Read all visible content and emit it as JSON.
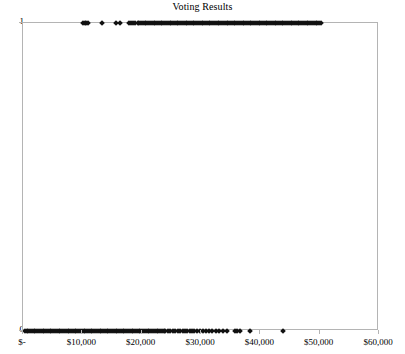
{
  "chart_data": {
    "type": "scatter",
    "title": "Voting Results",
    "xlabel": "",
    "ylabel": "",
    "xlim": [
      0,
      60000
    ],
    "ylim": [
      0,
      1
    ],
    "grid": false,
    "legend": null,
    "marker": "diamond",
    "marker_color": "#111111",
    "x_tick_labels": [
      "$-",
      "$10,000",
      "$20,000",
      "$30,000",
      "$40,000",
      "$50,000",
      "$60,000"
    ],
    "x_tick_values": [
      0,
      10000,
      20000,
      30000,
      40000,
      50000,
      60000
    ],
    "y_tick_labels": [
      "0",
      "1"
    ],
    "y_tick_values": [
      0,
      1
    ],
    "series": [
      {
        "name": "Voted (1)",
        "y": 1,
        "x": [
          10100,
          10450,
          10700,
          11000,
          13300,
          15600,
          16300,
          17900,
          18250,
          18600,
          18950,
          19300,
          19600,
          19900,
          20200,
          20500,
          20800,
          21100,
          21400,
          21700,
          22000,
          22300,
          22600,
          22900,
          23200,
          23500,
          23800,
          24100,
          24400,
          24700,
          25000,
          25300,
          25600,
          25900,
          26200,
          26500,
          26800,
          27100,
          27400,
          27700,
          28000,
          28300,
          28600,
          28900,
          29200,
          29500,
          29800,
          30100,
          30400,
          30700,
          31000,
          31300,
          31600,
          31900,
          32200,
          32500,
          32800,
          33100,
          33400,
          33700,
          34000,
          34300,
          34600,
          34900,
          35200,
          35500,
          35800,
          36100,
          36400,
          36700,
          37000,
          37300,
          37600,
          37900,
          38200,
          38500,
          38800,
          39100,
          39400,
          39700,
          40000,
          40300,
          40600,
          40900,
          41200,
          41500,
          41800,
          42100,
          42400,
          42700,
          43000,
          43300,
          43600,
          43900,
          44200,
          44500,
          44800,
          45100,
          45400,
          45700,
          46000,
          46300,
          46600,
          46900,
          47200,
          47500,
          47800,
          48100,
          48400,
          48700,
          49000,
          49300,
          49600,
          49900,
          50200
        ]
      },
      {
        "name": "Did not vote (0)",
        "y": 0,
        "x": [
          300,
          600,
          900,
          1200,
          1500,
          1800,
          2100,
          2400,
          2700,
          3000,
          3300,
          3600,
          3900,
          4200,
          4500,
          4800,
          5100,
          5400,
          5700,
          6000,
          6300,
          6600,
          6900,
          7200,
          7500,
          7800,
          8100,
          8400,
          8700,
          9000,
          9300,
          9600,
          9900,
          10200,
          10500,
          10800,
          11100,
          11400,
          11700,
          12000,
          12300,
          12600,
          12900,
          13200,
          13500,
          13800,
          14100,
          14400,
          14700,
          15000,
          15300,
          15600,
          15900,
          16200,
          16500,
          16800,
          17100,
          17400,
          17700,
          18000,
          18300,
          18600,
          18900,
          19200,
          19500,
          19800,
          20100,
          20400,
          20700,
          21000,
          21300,
          21600,
          21900,
          22200,
          22500,
          22800,
          23100,
          23400,
          23700,
          24000,
          24400,
          24800,
          25200,
          25700,
          26100,
          26500,
          26900,
          27300,
          27700,
          28100,
          28500,
          28900,
          29400,
          29900,
          30400,
          30900,
          31400,
          31900,
          32500,
          33100,
          33700,
          34300,
          35700,
          36100,
          36500,
          38300,
          43900
        ]
      }
    ]
  }
}
